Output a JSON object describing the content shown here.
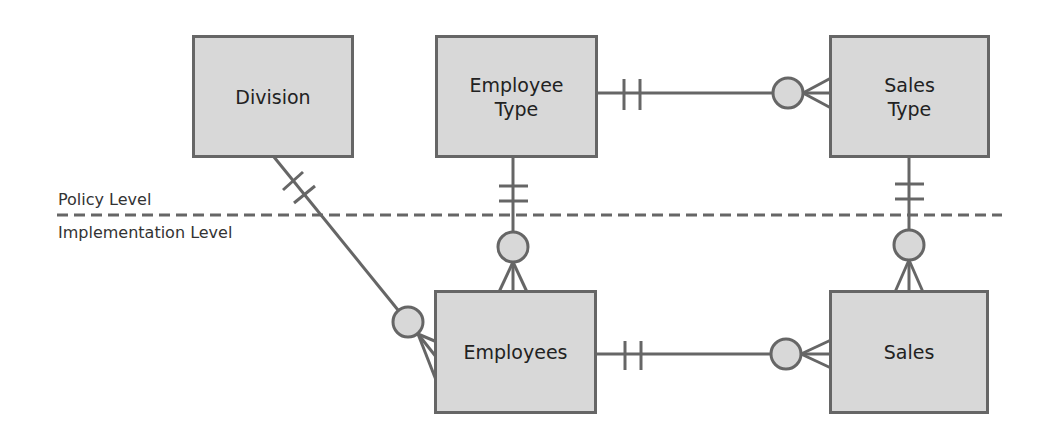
{
  "diagram": {
    "type": "entity-relationship",
    "levels": {
      "policy_label": "Policy Level",
      "implementation_label": "Implementation Level"
    },
    "entities": {
      "division": {
        "label": "Division",
        "level": "policy"
      },
      "employee_type": {
        "label": "Employee\nType",
        "level": "policy"
      },
      "sales_type": {
        "label": "Sales\nType",
        "level": "policy"
      },
      "employees": {
        "label": "Employees",
        "level": "implementation"
      },
      "sales": {
        "label": "Sales",
        "level": "implementation"
      }
    },
    "relationships": [
      {
        "from": "Employee Type",
        "to": "Sales Type",
        "from_cardinality": "exactly-one",
        "to_cardinality": "zero-or-many"
      },
      {
        "from": "Division",
        "to": "Employees",
        "from_cardinality": "exactly-one",
        "to_cardinality": "zero-or-many"
      },
      {
        "from": "Employee Type",
        "to": "Employees",
        "from_cardinality": "exactly-one",
        "to_cardinality": "zero-or-many"
      },
      {
        "from": "Sales Type",
        "to": "Sales",
        "from_cardinality": "exactly-one",
        "to_cardinality": "zero-or-many"
      },
      {
        "from": "Employees",
        "to": "Sales",
        "from_cardinality": "exactly-one",
        "to_cardinality": "zero-or-many"
      }
    ],
    "colors": {
      "entity_fill": "#d8d8d8",
      "entity_border": "#666666",
      "line": "#666666",
      "text": "#222222"
    }
  }
}
